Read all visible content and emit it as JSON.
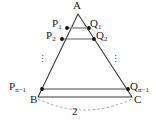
{
  "figure": {
    "background_color": "#ffffff",
    "stroke_color": "#3a3a3a",
    "segment_color": "#888888",
    "point_color": "#111111",
    "label_color": "#1a1a1a",
    "vertices": {
      "apex": {
        "label": "A",
        "x": 78,
        "y": 14
      },
      "bottom_left": {
        "label": "B",
        "x": 38,
        "y": 97
      },
      "bottom_right": {
        "label": "C",
        "x": 132,
        "y": 97
      }
    },
    "rows": [
      {
        "left_label": "P",
        "left_sub": "1",
        "right_label": "Q",
        "right_sub": "1",
        "y": 28,
        "x_left": 67,
        "x_right": 89
      },
      {
        "left_label": "P",
        "left_sub": "2",
        "right_label": "Q",
        "right_sub": "2",
        "y": 39,
        "x_left": 62,
        "x_right": 94
      },
      {
        "left_label": "P",
        "left_sub": "n−1",
        "right_label": "Q",
        "right_sub": "n−1",
        "y": 89,
        "x_left": 42,
        "x_right": 128
      }
    ],
    "ellipsis": {
      "glyph": "·",
      "left": {
        "x": 43,
        "y": 57
      },
      "right": {
        "x": 115,
        "y": 57
      }
    },
    "measure": {
      "label": "2",
      "x": 75,
      "y": 112,
      "arc_style": "dashed",
      "from": "B",
      "to": "C"
    }
  }
}
